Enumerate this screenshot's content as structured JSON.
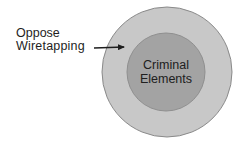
{
  "diagram": {
    "type": "nested-circles",
    "outer_circle": {
      "label_line1": "Oppose",
      "label_line2": "Wiretapping",
      "fill": "#c8c8c8",
      "stroke": "#8a8a8a"
    },
    "inner_circle": {
      "label_line1": "Criminal",
      "label_line2": "Elements",
      "fill": "#a3a3a3",
      "stroke": "#8a8a8a"
    },
    "arrow": {
      "from": "Oppose Wiretapping",
      "to": "outer-circle",
      "color": "#1e1e1e"
    }
  }
}
